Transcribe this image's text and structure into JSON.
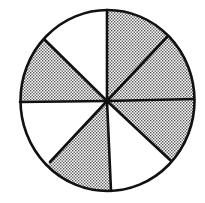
{
  "diagram": {
    "type": "fraction-circle",
    "total_sectors": 8,
    "shaded_sectors": 5,
    "fraction_shaded": "5/8",
    "sectors_clockwise_from_top": [
      {
        "index": 1,
        "shaded": true
      },
      {
        "index": 2,
        "shaded": true
      },
      {
        "index": 3,
        "shaded": true
      },
      {
        "index": 4,
        "shaded": false
      },
      {
        "index": 5,
        "shaded": true
      },
      {
        "index": 6,
        "shaded": false
      },
      {
        "index": 7,
        "shaded": true
      },
      {
        "index": 8,
        "shaded": false
      }
    ],
    "colors": {
      "stroke": "#111111",
      "shade_dot": "#555555",
      "shade_bg": "#ffffff",
      "unshaded": "#ffffff"
    }
  }
}
